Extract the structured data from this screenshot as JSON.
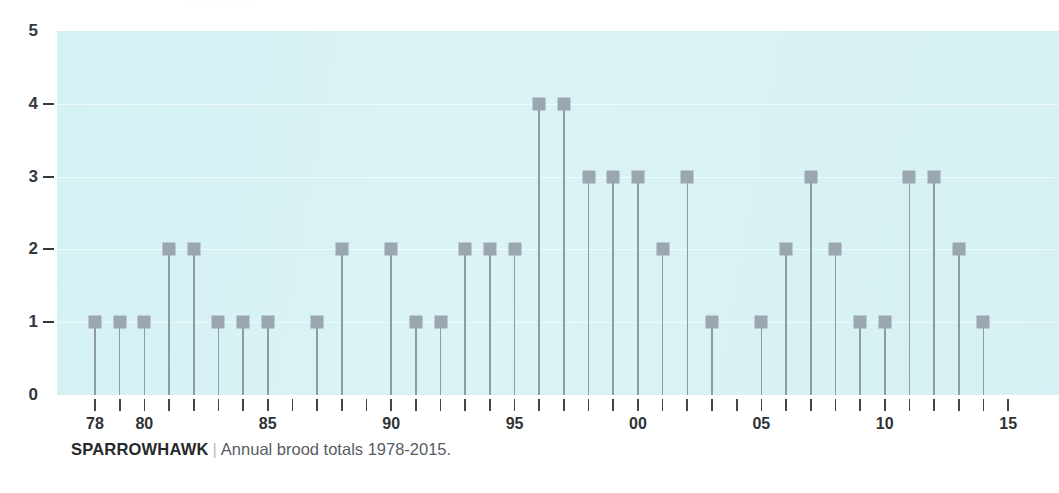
{
  "figure": {
    "top_strip_text": "· · · · · · · · · ·"
  },
  "caption": {
    "species": "SPARROWHAWK",
    "separator": "|",
    "description": "Annual brood totals 1978-2015."
  },
  "colors": {
    "plot_background": "#d8f2f4",
    "marker": "#9aa6b0",
    "stem": "#8e9aa4",
    "axis_text": "#2f3336",
    "caption_muted": "#5a6066"
  },
  "chart_data": {
    "type": "bar",
    "title": "SPARROWHAWK",
    "subtitle": "Annual brood totals 1978-2015.",
    "xlabel": "",
    "ylabel": "",
    "ylim": [
      0,
      5
    ],
    "xlim": [
      1978,
      2015
    ],
    "grid": true,
    "legend": false,
    "y_ticks": [
      0,
      1,
      2,
      3,
      4,
      5
    ],
    "y_tick_labels": [
      "0",
      "1",
      "2",
      "3",
      "4",
      "5"
    ],
    "x_tick_labels": [
      {
        "year": 1978,
        "label": "78"
      },
      {
        "year": 1979,
        "label": ""
      },
      {
        "year": 1980,
        "label": "80"
      },
      {
        "year": 1981,
        "label": ""
      },
      {
        "year": 1982,
        "label": ""
      },
      {
        "year": 1983,
        "label": ""
      },
      {
        "year": 1984,
        "label": ""
      },
      {
        "year": 1985,
        "label": "85"
      },
      {
        "year": 1986,
        "label": ""
      },
      {
        "year": 1987,
        "label": ""
      },
      {
        "year": 1988,
        "label": ""
      },
      {
        "year": 1989,
        "label": ""
      },
      {
        "year": 1990,
        "label": "90"
      },
      {
        "year": 1991,
        "label": ""
      },
      {
        "year": 1992,
        "label": ""
      },
      {
        "year": 1993,
        "label": ""
      },
      {
        "year": 1994,
        "label": ""
      },
      {
        "year": 1995,
        "label": "95"
      },
      {
        "year": 1996,
        "label": ""
      },
      {
        "year": 1997,
        "label": ""
      },
      {
        "year": 1998,
        "label": ""
      },
      {
        "year": 1999,
        "label": ""
      },
      {
        "year": 2000,
        "label": "00"
      },
      {
        "year": 2001,
        "label": ""
      },
      {
        "year": 2002,
        "label": ""
      },
      {
        "year": 2003,
        "label": ""
      },
      {
        "year": 2004,
        "label": ""
      },
      {
        "year": 2005,
        "label": "05"
      },
      {
        "year": 2006,
        "label": ""
      },
      {
        "year": 2007,
        "label": ""
      },
      {
        "year": 2008,
        "label": ""
      },
      {
        "year": 2009,
        "label": ""
      },
      {
        "year": 2010,
        "label": "10"
      },
      {
        "year": 2011,
        "label": ""
      },
      {
        "year": 2012,
        "label": ""
      },
      {
        "year": 2013,
        "label": ""
      },
      {
        "year": 2014,
        "label": ""
      },
      {
        "year": 2015,
        "label": "15"
      }
    ],
    "categories": [
      1978,
      1979,
      1980,
      1981,
      1982,
      1983,
      1984,
      1985,
      1986,
      1987,
      1988,
      1989,
      1990,
      1991,
      1992,
      1993,
      1994,
      1995,
      1996,
      1997,
      1998,
      1999,
      2000,
      2001,
      2002,
      2003,
      2004,
      2005,
      2006,
      2007,
      2008,
      2009,
      2010,
      2011,
      2012,
      2013,
      2014,
      2015
    ],
    "values": [
      1,
      1,
      1,
      2,
      2,
      1,
      1,
      1,
      0,
      1,
      2,
      0,
      2,
      1,
      1,
      2,
      2,
      2,
      4,
      4,
      3,
      3,
      3,
      2,
      3,
      1,
      0,
      1,
      2,
      3,
      2,
      1,
      1,
      3,
      3,
      2,
      1,
      0
    ]
  }
}
